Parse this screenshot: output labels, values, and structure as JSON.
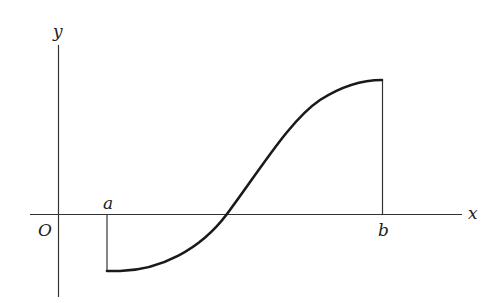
{
  "figure": {
    "axes": {
      "x_label": "x",
      "y_label": "y",
      "origin_label": "O"
    },
    "interval": {
      "left_label": "a",
      "right_label": "b"
    },
    "curve": {
      "description": "Continuous increasing S-shaped curve, negative at a, crossing the x-axis between a and b, positive at b",
      "stroke_color": "#1a1a1a"
    }
  }
}
